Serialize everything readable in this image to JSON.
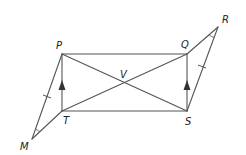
{
  "diagram": {
    "type": "geometry",
    "points": {
      "P": {
        "label": "P",
        "x": 62,
        "y": 54
      },
      "Q": {
        "label": "Q",
        "x": 187,
        "y": 54
      },
      "R": {
        "label": "R",
        "x": 218,
        "y": 27
      },
      "S": {
        "label": "S",
        "x": 187,
        "y": 111
      },
      "T": {
        "label": "T",
        "x": 62,
        "y": 111
      },
      "M": {
        "label": "M",
        "x": 32,
        "y": 139
      },
      "V": {
        "label": "V",
        "x": 124,
        "y": 83
      }
    },
    "segments": [
      "PQ",
      "TS",
      "PT",
      "QS",
      "PS",
      "QT",
      "PM",
      "MT",
      "QR",
      "RS"
    ],
    "markings": {
      "parallel_arrows": [
        "PT",
        "QS"
      ],
      "congruent_ticks": [
        "PM",
        "RS"
      ],
      "angle_arcs": [
        "M",
        "R"
      ]
    },
    "colors": {
      "line": "#555555",
      "label": "#222222",
      "background": "#ffffff"
    }
  }
}
